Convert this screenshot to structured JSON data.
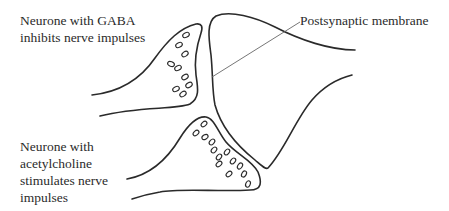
{
  "diagram": {
    "type": "synapse-diagram",
    "labels": {
      "gaba_neurone": {
        "lines": [
          "Neurone with GABA",
          "inhibits nerve impulses"
        ]
      },
      "ach_neurone": {
        "lines": [
          "Neurone with",
          "acetylcholine",
          "stimulates nerve",
          "impulses"
        ]
      },
      "postsynaptic": {
        "text": "Postsynaptic membrane"
      }
    },
    "colors": {
      "line": "#2a2a2a",
      "pointer": "#666666",
      "background": "#ffffff"
    },
    "structures": [
      {
        "name": "gaba-presynaptic-terminal",
        "vesicle_count": 10
      },
      {
        "name": "acetylcholine-presynaptic-terminal",
        "vesicle_count": 13
      },
      {
        "name": "postsynaptic-neurone"
      }
    ]
  }
}
